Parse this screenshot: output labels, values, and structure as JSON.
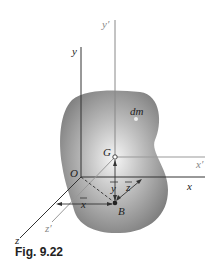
{
  "figure": {
    "caption": "Fig. 9.22",
    "labels": {
      "y_axis": "y",
      "y_prime_axis": "y′",
      "x_axis": "x",
      "x_prime_axis": "x′",
      "z_axis": "z",
      "z_prime_axis": "z′",
      "origin": "O",
      "centroid": "G",
      "point_b": "B",
      "mass_element": "dm",
      "x_bar": "x",
      "y_bar": "y",
      "z_bar": "z"
    },
    "colors": {
      "body_dark": "#7a7a7a",
      "body_light": "#f2f2f2",
      "axis_dark": "#333333",
      "axis_light": "#9a9a9a"
    }
  }
}
